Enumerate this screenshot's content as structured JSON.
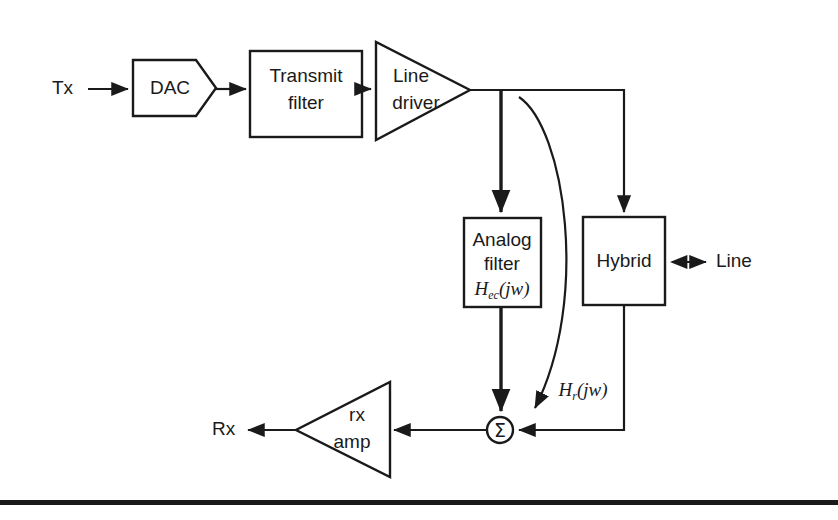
{
  "figure": {
    "type": "block-diagram",
    "title_text": "",
    "background": "#ffffff",
    "line_color": "#1a1a1a",
    "width": 838,
    "height": 520
  },
  "signals": {
    "tx": "Tx",
    "rx": "Rx",
    "line": "Line"
  },
  "blocks": {
    "dac": {
      "label": "DAC",
      "shape": "pentagon-arrow"
    },
    "transmit_filter": {
      "line1": "Transmit",
      "line2": "filter",
      "shape": "rectangle"
    },
    "line_driver": {
      "line1": "Line",
      "line2": "driver",
      "shape": "triangle-right"
    },
    "analog_filter": {
      "line1": "Analog",
      "line2": "filter",
      "transfer_h": "H",
      "transfer_sub": "ec",
      "transfer_arg": "(jw)",
      "shape": "rectangle"
    },
    "hybrid": {
      "label": "Hybrid",
      "shape": "rectangle"
    },
    "rx_amp": {
      "line1": "rx",
      "line2": "amp",
      "shape": "triangle-left"
    },
    "summer": {
      "glyph": "Σ",
      "shape": "circle"
    }
  },
  "annotations": {
    "echo_path": {
      "transfer_h": "H",
      "transfer_sub": "r",
      "transfer_arg": "(jw)"
    }
  },
  "footer": {
    "rule": "horizontal-rule"
  }
}
